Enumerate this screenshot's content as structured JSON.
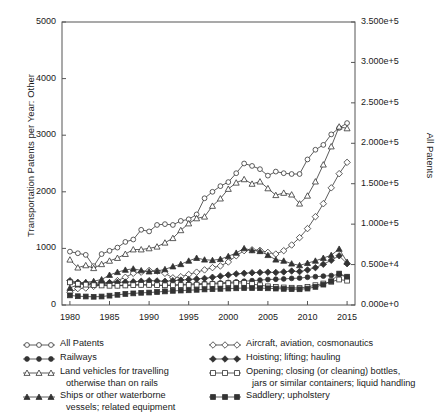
{
  "chart_data": {
    "type": "line",
    "title": "",
    "xlabel": "",
    "ylabel": "Transportation Patents per Year: Other",
    "ylabel_right": "All Patents",
    "xlim": [
      1979,
      2016
    ],
    "ylim": [
      0,
      5000
    ],
    "ylim_right": [
      0,
      350000
    ],
    "grid": false,
    "legend_position": "below-two-columns",
    "xticks": [
      "1980",
      "1985",
      "1990",
      "1995",
      "2000",
      "2005",
      "2010",
      "2015"
    ],
    "xtick_values": [
      1980,
      1985,
      1990,
      1995,
      2000,
      2005,
      2010,
      2015
    ],
    "yticks_left": [
      "0",
      "1000",
      "2000",
      "3000",
      "4000",
      "5000"
    ],
    "ytick_values_left": [
      0,
      1000,
      2000,
      3000,
      4000,
      5000
    ],
    "yticks_right": [
      "0.000e+0",
      "0.500e+4",
      "1.000e+5",
      "1.500e+5",
      "2.000e+5",
      "2.500e+5",
      "3.000e+5",
      "3.500e+5"
    ],
    "ytick_values_right": [
      0,
      50000,
      100000,
      150000,
      200000,
      250000,
      300000,
      350000
    ],
    "x": [
      1980,
      1981,
      1982,
      1983,
      1984,
      1985,
      1986,
      1987,
      1988,
      1989,
      1990,
      1991,
      1992,
      1993,
      1994,
      1995,
      1996,
      1997,
      1998,
      1999,
      2000,
      2001,
      2002,
      2003,
      2004,
      2005,
      2006,
      2007,
      2008,
      2009,
      2010,
      2011,
      2012,
      2013,
      2014,
      2015
    ],
    "series": [
      {
        "name": "All Patents",
        "axis": "right",
        "marker": "open-circle",
        "values": [
          66000,
          64000,
          62000,
          48000,
          63000,
          67000,
          71000,
          78000,
          81000,
          93000,
          91000,
          99000,
          100000,
          99000,
          104000,
          106000,
          112000,
          132000,
          140000,
          147000,
          152000,
          163000,
          175000,
          172000,
          168000,
          160000,
          165000,
          163000,
          162000,
          162000,
          180000,
          192000,
          198000,
          211000,
          219000,
          225000
        ]
      },
      {
        "name": "Land vehicles for travelling otherwise than on rails",
        "axis": "left",
        "marker": "open-triangle",
        "values": [
          800,
          660,
          700,
          650,
          720,
          780,
          830,
          900,
          980,
          980,
          1000,
          1030,
          1100,
          1180,
          1320,
          1440,
          1530,
          1560,
          1750,
          1880,
          2050,
          2160,
          2220,
          2140,
          2180,
          2060,
          1940,
          1980,
          1950,
          1790,
          1930,
          2180,
          2480,
          2800,
          3150,
          3120
        ]
      },
      {
        "name": "Aircraft, aviation, cosmonautics",
        "axis": "left",
        "marker": "open-diamond",
        "values": [
          225,
          290,
          300,
          330,
          360,
          395,
          430,
          490,
          560,
          580,
          610,
          600,
          560,
          480,
          500,
          540,
          580,
          620,
          660,
          690,
          760,
          870,
          960,
          975,
          965,
          930,
          900,
          960,
          1060,
          1190,
          1350,
          1560,
          1790,
          2070,
          2320,
          2520
        ]
      },
      {
        "name": "Ships or other waterborne vessels; related equipment",
        "axis": "left",
        "marker": "filled-triangle",
        "values": [
          300,
          360,
          400,
          420,
          450,
          530,
          580,
          620,
          640,
          610,
          590,
          600,
          630,
          680,
          720,
          780,
          830,
          800,
          790,
          810,
          860,
          920,
          1000,
          965,
          950,
          880,
          800,
          780,
          730,
          700,
          740,
          780,
          830,
          880,
          990,
          760
        ]
      },
      {
        "name": "Hoisting; lifting; hauling",
        "axis": "left",
        "marker": "filled-diamond",
        "values": [
          430,
          400,
          390,
          385,
          390,
          395,
          400,
          405,
          410,
          420,
          430,
          425,
          420,
          430,
          440,
          450,
          460,
          470,
          490,
          510,
          530,
          550,
          560,
          570,
          575,
          580,
          575,
          585,
          600,
          590,
          620,
          660,
          720,
          790,
          870,
          730
        ]
      },
      {
        "name": "Railways",
        "axis": "left",
        "marker": "filled-circle",
        "values": [
          400,
          380,
          370,
          365,
          360,
          350,
          345,
          350,
          355,
          360,
          355,
          350,
          345,
          350,
          360,
          370,
          375,
          380,
          385,
          390,
          400,
          410,
          420,
          430,
          440,
          450,
          455,
          460,
          470,
          475,
          490,
          500,
          510,
          520,
          540,
          490
        ]
      },
      {
        "name": "Opening; closing (or cleaning) bottles, jars or similar containers; liquid handling",
        "axis": "left",
        "marker": "open-square",
        "values": [
          400,
          375,
          360,
          350,
          345,
          340,
          340,
          345,
          350,
          355,
          355,
          350,
          348,
          350,
          352,
          355,
          360,
          365,
          370,
          375,
          385,
          390,
          390,
          370,
          350,
          330,
          320,
          310,
          305,
          300,
          320,
          350,
          380,
          410,
          450,
          430
        ]
      },
      {
        "name": "Saddlery; upholstery",
        "axis": "left",
        "marker": "filled-square",
        "values": [
          170,
          155,
          150,
          145,
          150,
          165,
          180,
          195,
          205,
          215,
          220,
          230,
          240,
          250,
          255,
          260,
          268,
          275,
          280,
          285,
          290,
          295,
          300,
          300,
          298,
          295,
          290,
          285,
          280,
          278,
          290,
          320,
          360,
          420,
          555,
          500
        ]
      }
    ]
  },
  "legend": {
    "left_column": [
      {
        "key": "open-circle",
        "label": "All Patents",
        "line2": ""
      },
      {
        "key": "filled-circle",
        "label": "Railways",
        "line2": ""
      },
      {
        "key": "open-triangle",
        "label": "Land vehicles for travelling",
        "line2": "otherwise than on rails"
      },
      {
        "key": "filled-triangle",
        "label": "Ships or other waterborne",
        "line2": "vessels; related equipment"
      }
    ],
    "right_column": [
      {
        "key": "open-diamond",
        "label": "Aircraft, aviation, cosmonautics",
        "line2": ""
      },
      {
        "key": "filled-diamond",
        "label": "Hoisting; lifting; hauling",
        "line2": ""
      },
      {
        "key": "open-square",
        "label": "Opening; closing (or cleaning) bottles,",
        "line2": "jars or similar containers; liquid handling"
      },
      {
        "key": "filled-square",
        "label": "Saddlery; upholstery",
        "line2": ""
      }
    ]
  },
  "colors": {
    "line": "#333333",
    "frame": "#555555",
    "text": "#1a1a1a",
    "background": "#ffffff"
  }
}
